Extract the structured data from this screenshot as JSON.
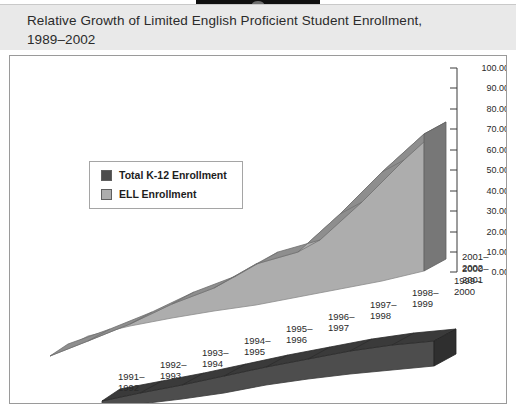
{
  "header": {
    "title": "Relative Growth of Limited English Proficient Student Enrollment,\n1989–2002"
  },
  "legend": {
    "items": [
      {
        "label": "Total K-12 Enrollment",
        "color": "#4d4d4d"
      },
      {
        "label": "ELL Enrollment",
        "color": "#adadad"
      }
    ]
  },
  "colors": {
    "header_band": "#e9e9e9",
    "panel_background": "#ffffff",
    "panel_border": "#9a9a9a",
    "ell_face": "#adadad",
    "ell_top": "#8e8e8e",
    "ell_side": "#8e8e8e",
    "k12_face": "#4d4d4d",
    "k12_top": "#3a3a3a",
    "axis_line": "#3a3a3a"
  },
  "chart_data": {
    "type": "area",
    "title": "Relative Growth of Limited English Proficient Student Enrollment, 1989–2002",
    "xlabel": "",
    "ylabel": "",
    "ylim": [
      0,
      100
    ],
    "grid": false,
    "legend_position": "upper-left",
    "categories": [
      "1991–1992",
      "1992–1993",
      "1993–1994",
      "1994–1995",
      "1995–1996",
      "1996–1997",
      "1997–1998",
      "1998–1999",
      "1999–2000",
      "2000–2001",
      "2001–2002"
    ],
    "ytick_labels": [
      "100.00%",
      "90.00%",
      "80.00%",
      "70.00%",
      "60.00%",
      "50.00%",
      "40.00%",
      "30.00%",
      "20.00%",
      "10.00%",
      "0.00%"
    ],
    "series": [
      {
        "name": "ELL Enrollment",
        "color": "#adadad",
        "values": [
          0,
          10,
          20,
          28,
          33,
          42,
          46,
          60,
          75,
          88,
          95
        ]
      },
      {
        "name": "Total K-12 Enrollment",
        "color": "#4d4d4d",
        "values": [
          0,
          1.5,
          3,
          4.5,
          6,
          7.5,
          9,
          10,
          10.8,
          11.5,
          12
        ]
      }
    ]
  }
}
